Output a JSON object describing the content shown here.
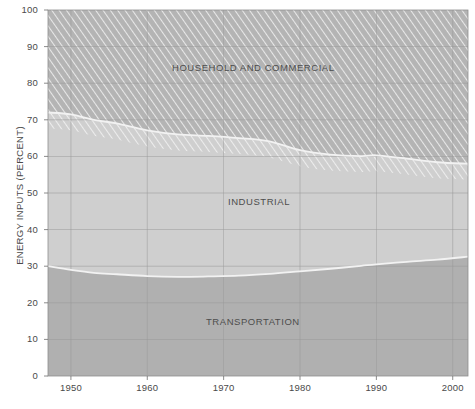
{
  "chart_data": {
    "type": "area",
    "title": "",
    "subtitle": "",
    "xlabel": "",
    "ylabel": "ENERGY INPUTS (PERCENT)",
    "xlim": [
      1947,
      2002
    ],
    "ylim": [
      0,
      100
    ],
    "grid": true,
    "legend_position": "inline-labels",
    "stacked": true,
    "stack_order_bottom_to_top": [
      "TRANSPORTATION",
      "INDUSTRIAL",
      "HOUSEHOLD AND COMMERCIAL"
    ],
    "x": [
      1947,
      1950,
      1953,
      1956,
      1960,
      1964,
      1968,
      1972,
      1976,
      1980,
      1984,
      1988,
      1990,
      1994,
      1998,
      2002
    ],
    "series": [
      {
        "name": "TRANSPORTATION",
        "label": "TRANSPORTATION",
        "values": [
          30.0,
          29.0,
          28.2,
          27.8,
          27.3,
          27.1,
          27.2,
          27.4,
          27.9,
          28.6,
          29.3,
          30.1,
          30.5,
          31.2,
          31.8,
          32.6
        ]
      },
      {
        "name": "INDUSTRIAL",
        "label": "INDUSTRIAL",
        "values": [
          42.0,
          42.5,
          41.8,
          41.2,
          39.8,
          38.9,
          38.4,
          37.6,
          36.2,
          33.1,
          31.2,
          30.0,
          29.8,
          28.2,
          26.6,
          25.4
        ]
      },
      {
        "name": "HOUSEHOLD AND COMMERCIAL",
        "label": "HOUSEHOLD AND COMMERCIAL",
        "values": [
          28.0,
          28.5,
          30.0,
          31.0,
          32.9,
          34.0,
          34.4,
          35.0,
          35.9,
          38.3,
          39.5,
          39.9,
          39.7,
          40.6,
          41.6,
          42.0
        ]
      }
    ],
    "cumulative_boundaries": {
      "note": "Upper edge of TRANSPORTATION and upper edge of INDUSTRIAL as percent of total",
      "transportation_top": [
        30.0,
        29.0,
        28.2,
        27.8,
        27.3,
        27.1,
        27.2,
        27.4,
        27.9,
        28.6,
        29.3,
        30.1,
        30.5,
        31.2,
        31.8,
        32.6
      ],
      "industrial_top": [
        72.0,
        71.5,
        70.0,
        69.0,
        67.1,
        66.0,
        65.6,
        65.0,
        64.1,
        61.7,
        60.5,
        60.1,
        60.3,
        59.4,
        58.4,
        58.0
      ]
    },
    "yticks": [
      0,
      10,
      20,
      30,
      40,
      50,
      60,
      70,
      80,
      90,
      100
    ],
    "ytick_labels": [
      "0",
      "10",
      "20",
      "30",
      "40",
      "50",
      "60",
      "70",
      "80",
      "90",
      "100"
    ],
    "xticks": [
      1950,
      1960,
      1970,
      1980,
      1990,
      2000
    ],
    "xtick_labels": [
      "1950",
      "1960",
      "1970",
      "1980",
      "1990",
      "2000"
    ],
    "colors": {
      "plot_background": "#c4c4c4",
      "transportation_fill": "#b0b0b0",
      "industrial_fill": "#cfcfcf",
      "household_fill": "#b4b4b4",
      "boundary_line": "#f2f2f2",
      "gridline": "#9a9a9a",
      "label_text": "#4d4d4d",
      "page_background": "#ffffff"
    }
  },
  "labels": {
    "household": "HOUSEHOLD AND COMMERCIAL",
    "industrial": "INDUSTRIAL",
    "transportation": "TRANSPORTATION",
    "y_axis_title": "ENERGY INPUTS (PERCENT)"
  }
}
